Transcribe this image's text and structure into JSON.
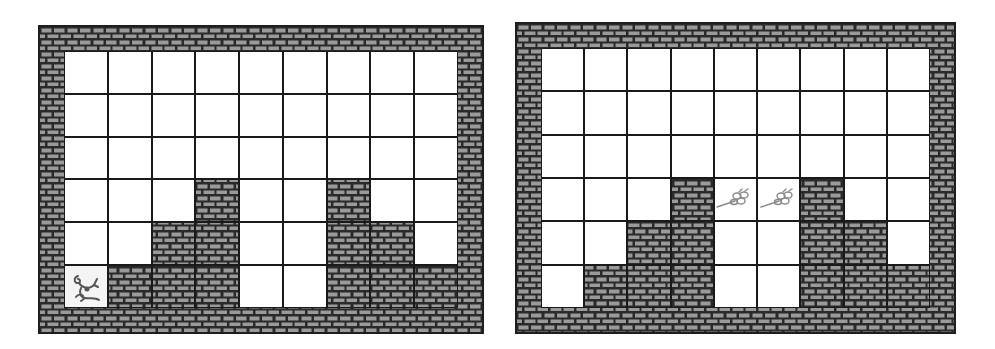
{
  "colors": {
    "brick_fill": "#9a9a9a",
    "mortar": "#2a2a2a",
    "cell_open": "#ffffff",
    "grid_line": "#1a1a1a",
    "icon_stroke": "#555555",
    "flower_stroke": "#8a8a8a"
  },
  "legend": {
    "wall": "W",
    "open": ".",
    "mouse": "M",
    "flower": "F"
  },
  "boards": [
    {
      "name": "left-board",
      "cols": 9,
      "rows": 6,
      "layout": [
        ".........",
        ".........",
        ".........",
        "...W..W..",
        "..WW..WW.",
        "MWWW..WWW"
      ]
    },
    {
      "name": "right-board",
      "cols": 9,
      "rows": 6,
      "layout": [
        ".........",
        ".........",
        ".........",
        "...WFFW..",
        "..WW..WW.",
        ".WWW..WWW"
      ]
    }
  ]
}
